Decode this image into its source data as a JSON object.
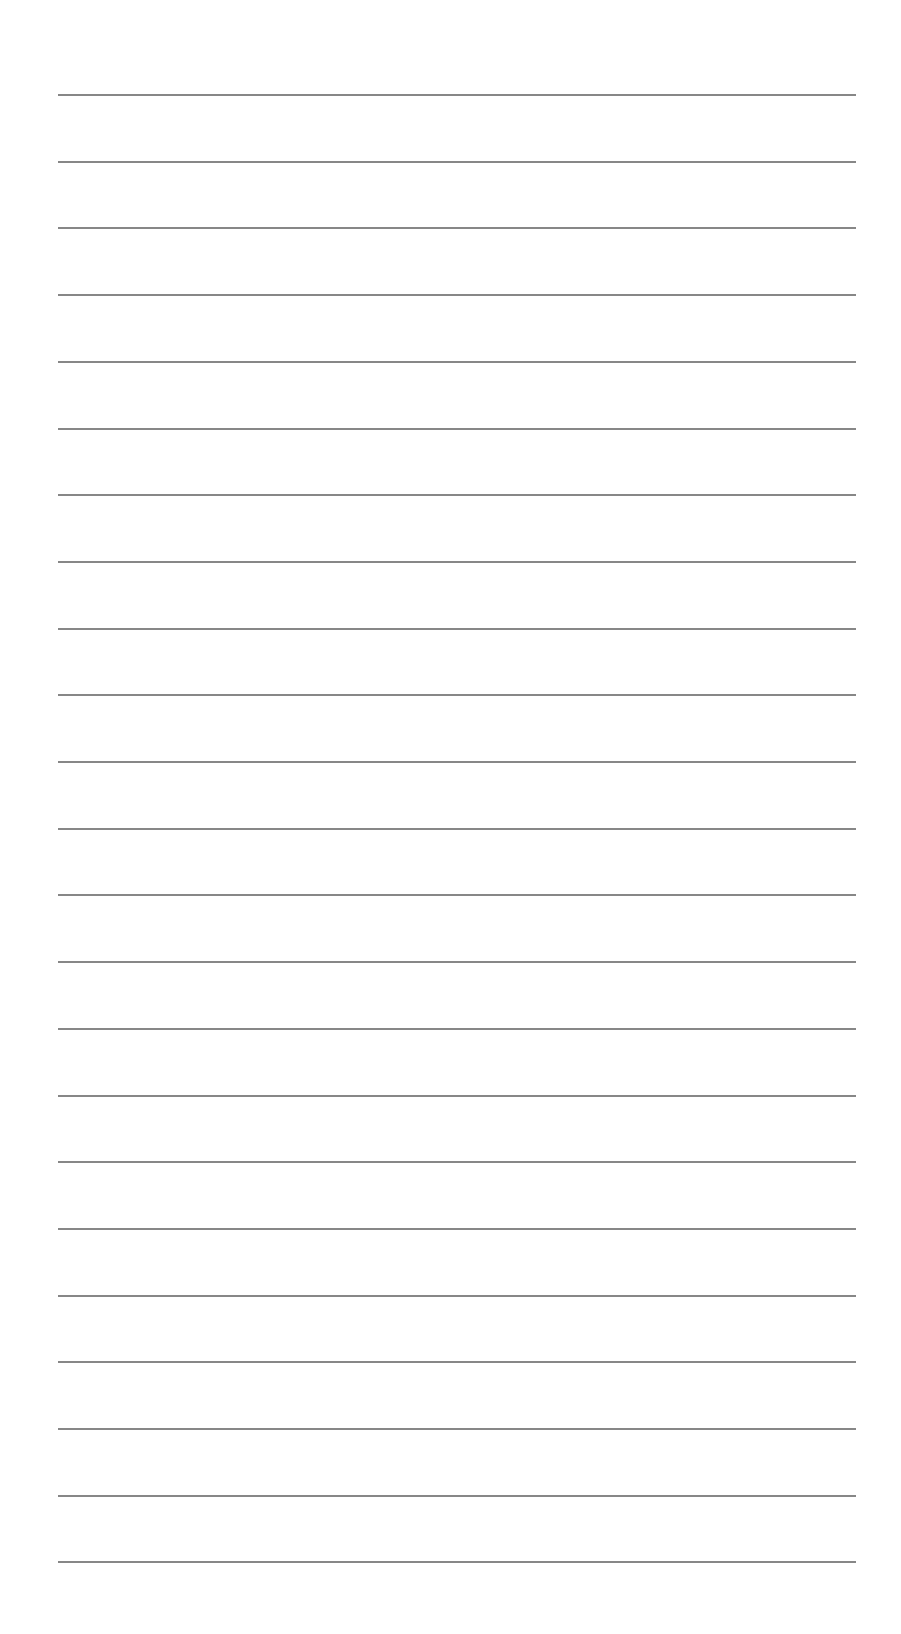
{
  "page": {
    "type": "lined-paper",
    "background_color": "#ffffff",
    "line_color": "#7a7a7a",
    "line_count": 23,
    "line_left": 58,
    "line_right": 856,
    "first_line_y": 94,
    "line_spacing": 66.7,
    "text_lines": [
      "",
      "",
      "",
      "",
      "",
      "",
      "",
      "",
      "",
      "",
      "",
      "",
      "",
      "",
      "",
      "",
      "",
      "",
      "",
      "",
      "",
      "",
      ""
    ]
  }
}
